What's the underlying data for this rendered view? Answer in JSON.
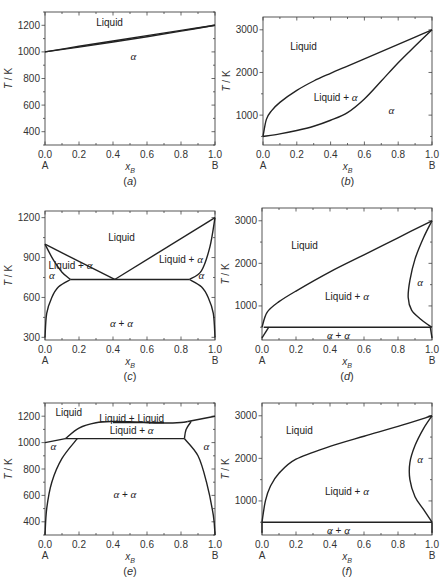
{
  "chart_data": [
    {
      "id": "a",
      "type": "line",
      "caption": "(a)",
      "xlabel": "x_B",
      "ylabel": "T / K",
      "xlim": [
        0,
        1
      ],
      "ylim": [
        300,
        1300
      ],
      "xticks": [
        "0.0",
        "0.2",
        "0.4",
        "0.6",
        "0.8",
        "1.0"
      ],
      "yticks": [
        400,
        600,
        800,
        1000,
        1200
      ],
      "endpoint_labels": [
        "A",
        "B"
      ],
      "regions": [
        {
          "label": "Liquid",
          "x": 0.38,
          "y": 1220
        },
        {
          "label": "α",
          "x": 0.52,
          "y": 960
        }
      ],
      "series": [
        {
          "name": "liquidus",
          "x": [
            0,
            0.2,
            0.4,
            0.6,
            0.8,
            1.0
          ],
          "y": [
            1000,
            1042,
            1082,
            1122,
            1162,
            1200
          ]
        },
        {
          "name": "solidus",
          "x": [
            0,
            0.2,
            0.4,
            0.6,
            0.8,
            1.0
          ],
          "y": [
            1000,
            1036,
            1074,
            1114,
            1156,
            1200
          ]
        }
      ]
    },
    {
      "id": "b",
      "type": "line",
      "caption": "(b)",
      "xlabel": "x_B",
      "ylabel": "T / K",
      "xlim": [
        0,
        1
      ],
      "ylim": [
        300,
        3300
      ],
      "xticks": [
        "0.0",
        "0.2",
        "0.4",
        "0.6",
        "0.8",
        "1.0"
      ],
      "yticks": [
        1000,
        2000,
        3000
      ],
      "endpoint_labels": [
        "A",
        "B"
      ],
      "regions": [
        {
          "label": "Liquid",
          "x": 0.24,
          "y": 2600
        },
        {
          "label": "Liquid + α",
          "x": 0.43,
          "y": 1400
        },
        {
          "label": "α",
          "x": 0.76,
          "y": 1100
        }
      ],
      "series": [
        {
          "name": "liquidus",
          "x": [
            0,
            0.02,
            0.05,
            0.1,
            0.2,
            0.3,
            0.4,
            0.5,
            0.6,
            0.7,
            0.8,
            0.9,
            1.0
          ],
          "y": [
            500,
            900,
            1100,
            1300,
            1580,
            1800,
            1980,
            2150,
            2320,
            2490,
            2660,
            2830,
            3000
          ]
        },
        {
          "name": "solidus",
          "x": [
            0,
            0.1,
            0.2,
            0.3,
            0.4,
            0.5,
            0.6,
            0.7,
            0.8,
            0.9,
            1.0
          ],
          "y": [
            500,
            560,
            640,
            740,
            880,
            1060,
            1380,
            1800,
            2230,
            2620,
            3000
          ]
        }
      ]
    },
    {
      "id": "c",
      "type": "line",
      "caption": "(c)",
      "xlabel": "x_B",
      "ylabel": "T / K",
      "xlim": [
        0,
        1
      ],
      "ylim": [
        280,
        1250
      ],
      "xticks": [
        "0.0",
        "0.2",
        "0.4",
        "0.6",
        "0.8",
        "1.0"
      ],
      "yticks": [
        300,
        600,
        900,
        1200
      ],
      "endpoint_labels": [
        "A",
        "B"
      ],
      "regions": [
        {
          "label": "Liquid",
          "x": 0.45,
          "y": 1050
        },
        {
          "label": "Liquid + α",
          "x": 0.15,
          "y": 840
        },
        {
          "label": "Liquid + α",
          "x": 0.8,
          "y": 880
        },
        {
          "label": "α",
          "x": 0.04,
          "y": 760
        },
        {
          "label": "α",
          "x": 0.92,
          "y": 760
        },
        {
          "label": "α + α",
          "x": 0.45,
          "y": 400
        }
      ],
      "series": [
        {
          "name": "liquidus-left",
          "x": [
            0,
            0.41
          ],
          "y": [
            1000,
            735
          ]
        },
        {
          "name": "liquidus-right",
          "x": [
            0.41,
            1.0
          ],
          "y": [
            735,
            1200
          ]
        },
        {
          "name": "eutectic",
          "x": [
            0.15,
            0.85
          ],
          "y": [
            735,
            735
          ]
        },
        {
          "name": "solidus-left",
          "x": [
            0,
            0.05,
            0.1,
            0.15
          ],
          "y": [
            1000,
            880,
            790,
            735
          ]
        },
        {
          "name": "solidus-right",
          "x": [
            0.85,
            0.92,
            0.97,
            1.0
          ],
          "y": [
            735,
            800,
            980,
            1200
          ]
        },
        {
          "name": "solvus-left",
          "x": [
            0,
            0.01,
            0.04,
            0.08,
            0.15
          ],
          "y": [
            300,
            480,
            600,
            680,
            735
          ]
        },
        {
          "name": "solvus-right",
          "x": [
            0.85,
            0.92,
            0.96,
            0.99,
            1.0
          ],
          "y": [
            735,
            680,
            600,
            480,
            300
          ]
        }
      ]
    },
    {
      "id": "d",
      "type": "line",
      "caption": "(d)",
      "xlabel": "x_B",
      "ylabel": "T / K",
      "xlim": [
        0,
        1
      ],
      "ylim": [
        200,
        3300
      ],
      "xticks": [
        "0.0",
        "0.2",
        "0.4",
        "0.6",
        "0.8",
        "1.0"
      ],
      "yticks": [
        1000,
        2000,
        3000
      ],
      "endpoint_labels": [
        "A",
        "B"
      ],
      "regions": [
        {
          "label": "Liquid",
          "x": 0.25,
          "y": 2400
        },
        {
          "label": "Liquid + α",
          "x": 0.5,
          "y": 1200
        },
        {
          "label": "α",
          "x": 0.93,
          "y": 1550
        },
        {
          "label": "α + α",
          "x": 0.45,
          "y": 300
        }
      ],
      "series": [
        {
          "name": "liquidus",
          "x": [
            0,
            0.03,
            0.1,
            0.2,
            0.4,
            0.6,
            0.8,
            1.0
          ],
          "y": [
            500,
            850,
            1100,
            1350,
            1800,
            2200,
            2600,
            3000
          ]
        },
        {
          "name": "solidus",
          "x": [
            1.0,
            0.95,
            0.9,
            0.87,
            0.86,
            0.88,
            0.93,
            0.98,
            1.0
          ],
          "y": [
            3000,
            2600,
            2100,
            1600,
            1200,
            900,
            700,
            550,
            500
          ]
        },
        {
          "name": "eutectic",
          "x": [
            0.01,
            0.99
          ],
          "y": [
            500,
            500
          ]
        },
        {
          "name": "solvus-left",
          "x": [
            0,
            0.04
          ],
          "y": [
            250,
            500
          ]
        },
        {
          "name": "solvus-right",
          "x": [
            0.99,
            1.0
          ],
          "y": [
            500,
            250
          ]
        }
      ]
    },
    {
      "id": "e",
      "type": "line",
      "caption": "(e)",
      "xlabel": "x_B",
      "ylabel": "T / K",
      "xlim": [
        0,
        1
      ],
      "ylim": [
        300,
        1300
      ],
      "xticks": [
        "0.0",
        "0.2",
        "0.4",
        "0.6",
        "0.8",
        "1.0"
      ],
      "yticks": [
        400,
        600,
        800,
        1000,
        1200
      ],
      "endpoint_labels": [
        "A",
        "B"
      ],
      "regions": [
        {
          "label": "Liquid",
          "x": 0.14,
          "y": 1225
        },
        {
          "label": "Liquid + Liquid",
          "x": 0.51,
          "y": 1180
        },
        {
          "label": "Liquid + α",
          "x": 0.51,
          "y": 1085
        },
        {
          "label": "α",
          "x": 0.05,
          "y": 965
        },
        {
          "label": "α",
          "x": 0.95,
          "y": 965
        },
        {
          "label": "α + α",
          "x": 0.47,
          "y": 600
        }
      ],
      "series": [
        {
          "name": "liquidus-left",
          "x": [
            0,
            0.12
          ],
          "y": [
            1000,
            1030
          ]
        },
        {
          "name": "miscibility-gap",
          "x": [
            0.12,
            0.2,
            0.3,
            0.4,
            0.5,
            0.6,
            0.7,
            0.8,
            0.84
          ],
          "y": [
            1030,
            1110,
            1150,
            1160,
            1158,
            1152,
            1148,
            1152,
            1160
          ]
        },
        {
          "name": "monotectic",
          "x": [
            0.4,
            0.7
          ],
          "y": [
            1152,
            1152
          ]
        },
        {
          "name": "liquidus-right",
          "x": [
            0.84,
            1.0
          ],
          "y": [
            1160,
            1200
          ]
        },
        {
          "name": "eutectic",
          "x": [
            0.12,
            0.82
          ],
          "y": [
            1030,
            1030
          ]
        },
        {
          "name": "solidus-right",
          "x": [
            0.82,
            0.83,
            0.86
          ],
          "y": [
            1030,
            1100,
            1160
          ]
        },
        {
          "name": "solvus-left",
          "x": [
            0,
            0.01,
            0.04,
            0.1,
            0.19
          ],
          "y": [
            300,
            500,
            700,
            880,
            1030
          ]
        },
        {
          "name": "solvus-right",
          "x": [
            0.82,
            0.9,
            0.95,
            0.99,
            1.0
          ],
          "y": [
            1030,
            900,
            700,
            450,
            300
          ]
        }
      ]
    },
    {
      "id": "f",
      "type": "line",
      "caption": "(f)",
      "xlabel": "x_B",
      "ylabel": "T / K",
      "xlim": [
        0,
        1
      ],
      "ylim": [
        200,
        3300
      ],
      "xticks": [
        "0.0",
        "0.2",
        "0.4",
        "0.6",
        "0.8",
        "1.0"
      ],
      "yticks": [
        1000,
        2000,
        3000
      ],
      "endpoint_labels": [
        "A",
        "B"
      ],
      "regions": [
        {
          "label": "Liquid",
          "x": 0.22,
          "y": 2650
        },
        {
          "label": "Liquid + α",
          "x": 0.5,
          "y": 1200
        },
        {
          "label": "α",
          "x": 0.93,
          "y": 1950
        },
        {
          "label": "α + α",
          "x": 0.45,
          "y": 300
        }
      ],
      "series": [
        {
          "name": "liquidus",
          "x": [
            0,
            0.02,
            0.05,
            0.1,
            0.2,
            0.4,
            0.6,
            0.8,
            1.0
          ],
          "y": [
            500,
            1000,
            1350,
            1650,
            1980,
            2280,
            2520,
            2750,
            3000
          ]
        },
        {
          "name": "solidus",
          "x": [
            1.0,
            0.95,
            0.9,
            0.87,
            0.87,
            0.9,
            0.95,
            1.0
          ],
          "y": [
            3000,
            2700,
            2300,
            1900,
            1500,
            1100,
            800,
            500
          ]
        },
        {
          "name": "eutectic",
          "x": [
            0,
            1.0
          ],
          "y": [
            500,
            500
          ]
        },
        {
          "name": "solvus-left",
          "x": [
            0,
            0
          ],
          "y": [
            250,
            500
          ]
        },
        {
          "name": "solvus-right",
          "x": [
            1.0,
            1.0
          ],
          "y": [
            500,
            250
          ]
        }
      ]
    }
  ],
  "layout": {
    "panels": [
      {
        "id": "a",
        "x0": 45,
        "y0": 12,
        "x1": 215,
        "y1": 145
      },
      {
        "id": "b",
        "x0": 263,
        "y0": 17,
        "x1": 432,
        "y1": 145
      },
      {
        "id": "c",
        "x0": 45,
        "y0": 211,
        "x1": 215,
        "y1": 340
      },
      {
        "id": "d",
        "x0": 262,
        "y0": 208,
        "x1": 432,
        "y1": 340
      },
      {
        "id": "e",
        "x0": 45,
        "y0": 403,
        "x1": 215,
        "y1": 535
      },
      {
        "id": "f",
        "x0": 262,
        "y0": 403,
        "x1": 432,
        "y1": 535
      }
    ]
  }
}
